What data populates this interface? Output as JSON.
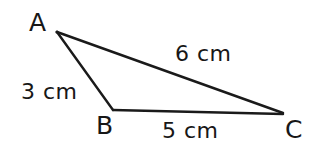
{
  "figure": {
    "type": "triangle-diagram",
    "background_color": "#ffffff",
    "stroke_color": "#1a1a1a",
    "text_color": "#171717"
  },
  "vertices": {
    "a": {
      "label": "A",
      "x": 57,
      "y": 32
    },
    "b": {
      "label": "B",
      "x": 113,
      "y": 110
    },
    "c": {
      "label": "C",
      "x": 283,
      "y": 113
    }
  },
  "sides": {
    "ac": {
      "label": "6 cm",
      "value": 6,
      "unit": "cm",
      "from": "A",
      "to": "C"
    },
    "ab": {
      "label": "3 cm",
      "value": 3,
      "unit": "cm",
      "from": "A",
      "to": "B"
    },
    "bc": {
      "label": "5 cm",
      "value": 5,
      "unit": "cm",
      "from": "B",
      "to": "C"
    }
  },
  "chart_data": {
    "type": "diagram",
    "title": "",
    "shape": "scalene triangle",
    "points": [
      {
        "name": "A",
        "x": 57,
        "y": 32
      },
      {
        "name": "B",
        "x": 113,
        "y": 110
      },
      {
        "name": "C",
        "x": 283,
        "y": 113
      }
    ],
    "edges": [
      {
        "from": "A",
        "to": "C",
        "label": "6 cm",
        "length": 6
      },
      {
        "from": "A",
        "to": "B",
        "label": "3 cm",
        "length": 3
      },
      {
        "from": "B",
        "to": "C",
        "label": "5 cm",
        "length": 5
      }
    ],
    "unit": "cm"
  }
}
